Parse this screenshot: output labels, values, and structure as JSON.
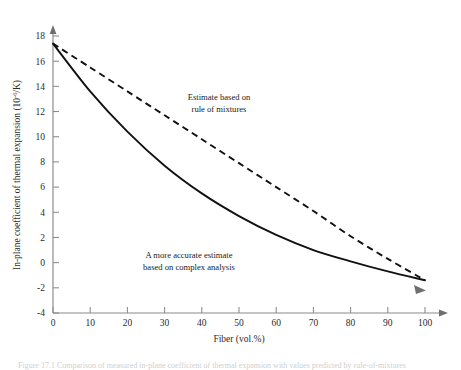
{
  "figure": {
    "background": "#ffffff",
    "ink": "#111111",
    "axis_color": "#8a8a8a"
  },
  "chart_data": {
    "type": "line",
    "title": "",
    "xlabel": "Fiber (vol.%)",
    "ylabel": "In-plane coefficient of thermal expansion (10",
    "ylabel_sup": "-6",
    "ylabel_tail": "/K)",
    "xlim": [
      0,
      100
    ],
    "ylim": [
      -4,
      18
    ],
    "xticks": [
      0,
      10,
      20,
      30,
      40,
      50,
      60,
      70,
      80,
      90,
      100
    ],
    "xtick_labels": [
      "0",
      "10",
      "20",
      "30",
      "40",
      "50",
      "60",
      "70",
      "80",
      "90",
      "100"
    ],
    "yticks": [
      -4,
      -2,
      0,
      2,
      4,
      6,
      8,
      10,
      12,
      14,
      16,
      18
    ],
    "ytick_labels": [
      "-4",
      "-2",
      "0",
      "2",
      "4",
      "6",
      "8",
      "10",
      "12",
      "14",
      "16",
      "18"
    ],
    "grid": false,
    "legend_position": "inline-annotations",
    "series": [
      {
        "name": "Estimate based on rule of mixtures",
        "style": "dashed",
        "x": [
          0,
          10,
          20,
          30,
          40,
          50,
          60,
          70,
          80,
          90,
          100
        ],
        "values": [
          17.4,
          15.5,
          13.6,
          11.7,
          9.8,
          7.9,
          6.0,
          4.1,
          2.1,
          0.3,
          -1.4
        ]
      },
      {
        "name": "A more accurate estimate based on complex analysis",
        "style": "solid",
        "x": [
          0,
          10,
          20,
          30,
          40,
          50,
          60,
          70,
          80,
          90,
          100
        ],
        "values": [
          17.4,
          13.6,
          10.4,
          7.7,
          5.5,
          3.7,
          2.2,
          1.0,
          0.1,
          -0.7,
          -1.4
        ]
      }
    ],
    "annotations": [
      {
        "name": "rule-of-mixtures-label",
        "lines": [
          "Estimate based on",
          "rule of mixtures"
        ],
        "x": 48,
        "y": 12.6
      },
      {
        "name": "complex-analysis-label",
        "lines": [
          "A more accurate estimate",
          "based on complex analysis"
        ],
        "x": 40,
        "y": 0.9
      }
    ]
  },
  "caption": {
    "text": "Figure 17.1   Comparison of measured in-plane coefficient of thermal expansion with values predicted by rule-of-mixtures"
  }
}
